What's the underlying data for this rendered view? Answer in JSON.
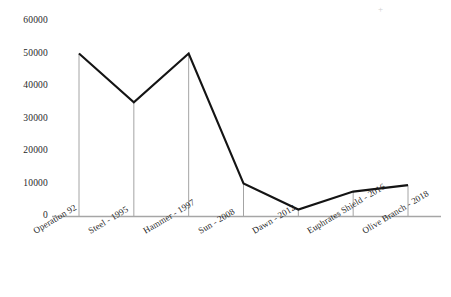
{
  "chart_data": {
    "type": "line",
    "title": "",
    "subtitle": "",
    "xlabel": "",
    "ylabel": "",
    "categories": [
      "Operation 92",
      "Steel - 1995",
      "Hammer - 1997",
      "Sun - 2008",
      "Dawn - 2012",
      "Euphrates Shield - 2016",
      "Olive Branch - 2018"
    ],
    "values": [
      50000,
      35000,
      50000,
      10000,
      2000,
      7500,
      9500
    ],
    "series": [
      {
        "name": "Troops",
        "values": [
          50000,
          35000,
          50000,
          10000,
          2000,
          7500,
          9500
        ]
      }
    ],
    "ylim": [
      0,
      60000
    ],
    "yticks": [
      0,
      10000,
      20000,
      30000,
      40000,
      50000,
      60000
    ],
    "ytick_labels": [
      "0",
      "10000",
      "20000",
      "30000",
      "40000",
      "50000",
      "60000"
    ],
    "grid": false,
    "legend": "none",
    "markers": false,
    "droplines": true,
    "colors": {
      "line": "#141414",
      "axis": "#a6a6a6",
      "dropline": "#9a9a9a",
      "text": "#1f1f1f",
      "background": "#ffffff"
    }
  },
  "axes": {
    "y_axis_name": "y-axis",
    "x_axis_name": "x-axis"
  },
  "artifacts": {
    "top_right_mark": "+"
  }
}
